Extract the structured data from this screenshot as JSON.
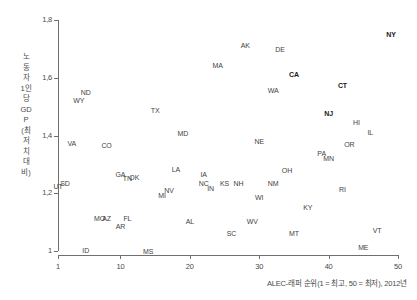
{
  "chart_data": {
    "type": "scatter",
    "title": "",
    "xlabel": "ALEC-래퍼 순위(1 = 최고, 50 = 최저), 2012년",
    "ylabel": "노동자 1인당 GDP (최저치 대비)",
    "xlim": [
      1,
      50
    ],
    "ylim": [
      1.0,
      1.8
    ],
    "xticks": [
      "1",
      "10",
      "20",
      "30",
      "40",
      "50"
    ],
    "xtick_values": [
      1,
      10,
      20,
      30,
      40,
      50
    ],
    "yticks": [
      "1",
      "1,2",
      "1,4",
      "1,6",
      "1,8"
    ],
    "ytick_values": [
      1.0,
      1.2,
      1.4,
      1.6,
      1.8
    ],
    "grid": false,
    "legend": null,
    "point_style": "text-label-only",
    "highlight_states": [
      "NY",
      "CA",
      "CT",
      "NJ"
    ],
    "points": [
      {
        "label": "UT",
        "x": 1,
        "y": 1.225,
        "bold": false
      },
      {
        "label": "SD",
        "x": 2,
        "y": 1.235,
        "bold": false
      },
      {
        "label": "VA",
        "x": 3,
        "y": 1.373,
        "bold": false
      },
      {
        "label": "WY",
        "x": 4,
        "y": 1.522,
        "bold": false
      },
      {
        "label": "ND",
        "x": 5,
        "y": 1.552,
        "bold": false
      },
      {
        "label": "ID",
        "x": 5,
        "y": 1.002,
        "bold": false
      },
      {
        "label": "MO",
        "x": 7,
        "y": 1.114,
        "bold": false
      },
      {
        "label": "AZ",
        "x": 8,
        "y": 1.114,
        "bold": false
      },
      {
        "label": "CO",
        "x": 8,
        "y": 1.368,
        "bold": false
      },
      {
        "label": "GA",
        "x": 10,
        "y": 1.267,
        "bold": false
      },
      {
        "label": "AR",
        "x": 10,
        "y": 1.086,
        "bold": false
      },
      {
        "label": "TN",
        "x": 11,
        "y": 1.252,
        "bold": false
      },
      {
        "label": "FL",
        "x": 11,
        "y": 1.115,
        "bold": false
      },
      {
        "label": "OK",
        "x": 12,
        "y": 1.258,
        "bold": false
      },
      {
        "label": "MS",
        "x": 14,
        "y": 1.001,
        "bold": false
      },
      {
        "label": "TX",
        "x": 15,
        "y": 1.489,
        "bold": false
      },
      {
        "label": "MI",
        "x": 16,
        "y": 1.194,
        "bold": false
      },
      {
        "label": "NV",
        "x": 17,
        "y": 1.212,
        "bold": false
      },
      {
        "label": "LA",
        "x": 18,
        "y": 1.283,
        "bold": false
      },
      {
        "label": "MD",
        "x": 19,
        "y": 1.408,
        "bold": false
      },
      {
        "label": "AL",
        "x": 20,
        "y": 1.105,
        "bold": false
      },
      {
        "label": "IA",
        "x": 22,
        "y": 1.268,
        "bold": false
      },
      {
        "label": "NC",
        "x": 22,
        "y": 1.234,
        "bold": false
      },
      {
        "label": "IN",
        "x": 23,
        "y": 1.219,
        "bold": false
      },
      {
        "label": "MA",
        "x": 24,
        "y": 1.645,
        "bold": false
      },
      {
        "label": "KS",
        "x": 25,
        "y": 1.236,
        "bold": false
      },
      {
        "label": "SC",
        "x": 26,
        "y": 1.062,
        "bold": false
      },
      {
        "label": "NH",
        "x": 27,
        "y": 1.236,
        "bold": false
      },
      {
        "label": "AK",
        "x": 28,
        "y": 1.712,
        "bold": false
      },
      {
        "label": "WV",
        "x": 29,
        "y": 1.104,
        "bold": false
      },
      {
        "label": "WI",
        "x": 30,
        "y": 1.188,
        "bold": false
      },
      {
        "label": "NE",
        "x": 30,
        "y": 1.38,
        "bold": false
      },
      {
        "label": "NM",
        "x": 32,
        "y": 1.237,
        "bold": false
      },
      {
        "label": "WA",
        "x": 32,
        "y": 1.558,
        "bold": false
      },
      {
        "label": "DE",
        "x": 33,
        "y": 1.698,
        "bold": false
      },
      {
        "label": "OH",
        "x": 34,
        "y": 1.28,
        "bold": false
      },
      {
        "label": "CA",
        "x": 35,
        "y": 1.612,
        "bold": true
      },
      {
        "label": "MT",
        "x": 35,
        "y": 1.063,
        "bold": false
      },
      {
        "label": "KY",
        "x": 37,
        "y": 1.152,
        "bold": false
      },
      {
        "label": "PA",
        "x": 39,
        "y": 1.34,
        "bold": false
      },
      {
        "label": "MN",
        "x": 40,
        "y": 1.322,
        "bold": false
      },
      {
        "label": "NJ",
        "x": 40,
        "y": 1.478,
        "bold": true
      },
      {
        "label": "CT",
        "x": 42,
        "y": 1.575,
        "bold": true
      },
      {
        "label": "RI",
        "x": 42,
        "y": 1.215,
        "bold": false
      },
      {
        "label": "OR",
        "x": 43,
        "y": 1.372,
        "bold": false
      },
      {
        "label": "HI",
        "x": 44,
        "y": 1.448,
        "bold": false
      },
      {
        "label": "ME",
        "x": 45,
        "y": 1.015,
        "bold": false
      },
      {
        "label": "IL",
        "x": 46,
        "y": 1.412,
        "bold": false
      },
      {
        "label": "VT",
        "x": 47,
        "y": 1.072,
        "bold": false
      },
      {
        "label": "NY",
        "x": 49,
        "y": 1.752,
        "bold": true
      }
    ]
  },
  "axis": {
    "y_title_text": "노동자 1인당 GDP (최저치 대비)",
    "caption_text": "ALEC-래퍼 순위(1 = 최고, 50 = 최저), 2012년"
  }
}
